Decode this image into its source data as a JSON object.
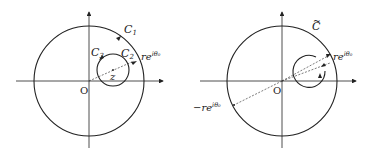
{
  "left": {
    "outer_label": "C",
    "outer_sub": "1",
    "small_label_right": "C",
    "small_sub_right": "2",
    "small_label_left": "C",
    "small_sub_left": "3",
    "point_label": "z",
    "origin_label": "O",
    "ray_label": "re",
    "ray_exp": "iθ₀"
  },
  "right": {
    "contour_label": "C",
    "contour_tilde": "~",
    "origin_label": "O",
    "ray_label": "re",
    "ray_exp": "iθ₀",
    "neg_ray_label": "−re",
    "neg_ray_exp": "iθ₀"
  },
  "colors": {
    "stroke": "#222222",
    "background": "#ffffff"
  }
}
